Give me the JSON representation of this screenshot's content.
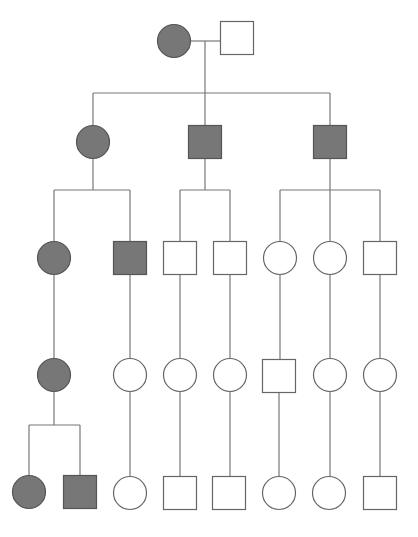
{
  "diagram": {
    "type": "pedigree",
    "colors": {
      "affected_fill": "#777777",
      "affected_stroke": "#555555",
      "unaffected_fill": "#ffffff",
      "unaffected_stroke": "#666666",
      "line": "#777777"
    },
    "symbol_size": 33,
    "individuals": [
      {
        "id": "I-1",
        "sex": "female",
        "affected": true,
        "x": 174,
        "y": 41
      },
      {
        "id": "I-2",
        "sex": "male",
        "affected": false,
        "x": 237,
        "y": 38
      },
      {
        "id": "II-1",
        "sex": "female",
        "affected": true,
        "x": 93,
        "y": 142
      },
      {
        "id": "II-2",
        "sex": "male",
        "affected": true,
        "x": 205,
        "y": 142
      },
      {
        "id": "II-3",
        "sex": "male",
        "affected": true,
        "x": 330,
        "y": 142
      },
      {
        "id": "III-1",
        "sex": "female",
        "affected": true,
        "x": 54,
        "y": 258
      },
      {
        "id": "III-2",
        "sex": "male",
        "affected": true,
        "x": 130,
        "y": 258
      },
      {
        "id": "III-3",
        "sex": "male",
        "affected": false,
        "x": 180,
        "y": 258
      },
      {
        "id": "III-4",
        "sex": "male",
        "affected": false,
        "x": 230,
        "y": 258
      },
      {
        "id": "III-5",
        "sex": "female",
        "affected": false,
        "x": 280,
        "y": 258
      },
      {
        "id": "III-6",
        "sex": "female",
        "affected": false,
        "x": 330,
        "y": 258
      },
      {
        "id": "III-7",
        "sex": "male",
        "affected": false,
        "x": 380,
        "y": 258
      },
      {
        "id": "IV-1",
        "sex": "female",
        "affected": true,
        "x": 54,
        "y": 375
      },
      {
        "id": "IV-2",
        "sex": "female",
        "affected": false,
        "x": 130,
        "y": 375
      },
      {
        "id": "IV-3",
        "sex": "female",
        "affected": false,
        "x": 180,
        "y": 375
      },
      {
        "id": "IV-4",
        "sex": "female",
        "affected": false,
        "x": 230,
        "y": 375
      },
      {
        "id": "IV-5",
        "sex": "male",
        "affected": false,
        "x": 279,
        "y": 376
      },
      {
        "id": "IV-6",
        "sex": "female",
        "affected": false,
        "x": 330,
        "y": 375
      },
      {
        "id": "IV-7",
        "sex": "female",
        "affected": false,
        "x": 380,
        "y": 375
      },
      {
        "id": "V-1",
        "sex": "female",
        "affected": true,
        "x": 29,
        "y": 492
      },
      {
        "id": "V-2",
        "sex": "male",
        "affected": true,
        "x": 80,
        "y": 492
      },
      {
        "id": "V-3",
        "sex": "female",
        "affected": false,
        "x": 130,
        "y": 493
      },
      {
        "id": "V-4",
        "sex": "male",
        "affected": false,
        "x": 180,
        "y": 493
      },
      {
        "id": "V-5",
        "sex": "male",
        "affected": false,
        "x": 229,
        "y": 493
      },
      {
        "id": "V-6",
        "sex": "female",
        "affected": false,
        "x": 279,
        "y": 493
      },
      {
        "id": "V-7",
        "sex": "female",
        "affected": false,
        "x": 329,
        "y": 493
      },
      {
        "id": "V-8",
        "sex": "male",
        "affected": false,
        "x": 380,
        "y": 493
      }
    ],
    "lines": [
      {
        "name": "mating-line-I",
        "x1": 190,
        "y1": 41,
        "x2": 221,
        "y2": 41
      },
      {
        "name": "descent-line-I",
        "x1": 205,
        "y1": 41,
        "x2": 205,
        "y2": 93
      },
      {
        "name": "sibship-line-II",
        "x1": 93,
        "y1": 93,
        "x2": 330,
        "y2": 93
      },
      {
        "name": "drop-II-1",
        "x1": 93,
        "y1": 93,
        "x2": 93,
        "y2": 126
      },
      {
        "name": "drop-II-2",
        "x1": 205,
        "y1": 93,
        "x2": 205,
        "y2": 125
      },
      {
        "name": "drop-II-3",
        "x1": 330,
        "y1": 93,
        "x2": 330,
        "y2": 125
      },
      {
        "name": "descent-line-II-1",
        "x1": 93,
        "y1": 158,
        "x2": 93,
        "y2": 190
      },
      {
        "name": "sibship-line-III-a",
        "x1": 54,
        "y1": 190,
        "x2": 130,
        "y2": 190
      },
      {
        "name": "drop-III-1",
        "x1": 54,
        "y1": 190,
        "x2": 54,
        "y2": 242
      },
      {
        "name": "drop-III-2",
        "x1": 130,
        "y1": 190,
        "x2": 130,
        "y2": 242
      },
      {
        "name": "descent-line-II-2",
        "x1": 205,
        "y1": 158,
        "x2": 205,
        "y2": 190
      },
      {
        "name": "sibship-line-III-b",
        "x1": 180,
        "y1": 190,
        "x2": 230,
        "y2": 190
      },
      {
        "name": "drop-III-3",
        "x1": 180,
        "y1": 190,
        "x2": 180,
        "y2": 242
      },
      {
        "name": "drop-III-4",
        "x1": 230,
        "y1": 190,
        "x2": 230,
        "y2": 242
      },
      {
        "name": "descent-line-II-3",
        "x1": 330,
        "y1": 158,
        "x2": 330,
        "y2": 190
      },
      {
        "name": "sibship-line-III-c",
        "x1": 280,
        "y1": 190,
        "x2": 380,
        "y2": 190
      },
      {
        "name": "drop-III-5",
        "x1": 280,
        "y1": 190,
        "x2": 280,
        "y2": 242
      },
      {
        "name": "drop-III-6",
        "x1": 330,
        "y1": 190,
        "x2": 330,
        "y2": 242
      },
      {
        "name": "drop-III-7",
        "x1": 380,
        "y1": 190,
        "x2": 380,
        "y2": 242
      },
      {
        "name": "descent-III-1",
        "x1": 54,
        "y1": 274,
        "x2": 54,
        "y2": 359
      },
      {
        "name": "descent-III-2",
        "x1": 130,
        "y1": 275,
        "x2": 130,
        "y2": 359
      },
      {
        "name": "descent-III-3",
        "x1": 180,
        "y1": 275,
        "x2": 180,
        "y2": 359
      },
      {
        "name": "descent-III-4",
        "x1": 230,
        "y1": 275,
        "x2": 230,
        "y2": 359
      },
      {
        "name": "descent-III-5",
        "x1": 280,
        "y1": 274,
        "x2": 280,
        "y2": 360
      },
      {
        "name": "descent-III-6",
        "x1": 330,
        "y1": 274,
        "x2": 330,
        "y2": 359
      },
      {
        "name": "descent-III-7",
        "x1": 380,
        "y1": 275,
        "x2": 380,
        "y2": 359
      },
      {
        "name": "descent-IV-1",
        "x1": 54,
        "y1": 391,
        "x2": 54,
        "y2": 425
      },
      {
        "name": "sibship-line-V-a",
        "x1": 29,
        "y1": 425,
        "x2": 80,
        "y2": 425
      },
      {
        "name": "drop-V-1",
        "x1": 29,
        "y1": 425,
        "x2": 29,
        "y2": 476
      },
      {
        "name": "drop-V-2",
        "x1": 80,
        "y1": 425,
        "x2": 80,
        "y2": 476
      },
      {
        "name": "descent-IV-2",
        "x1": 130,
        "y1": 391,
        "x2": 130,
        "y2": 477
      },
      {
        "name": "descent-IV-3",
        "x1": 180,
        "y1": 391,
        "x2": 180,
        "y2": 477
      },
      {
        "name": "descent-IV-4",
        "x1": 230,
        "y1": 391,
        "x2": 230,
        "y2": 477
      },
      {
        "name": "descent-IV-5",
        "x1": 279,
        "y1": 393,
        "x2": 279,
        "y2": 477
      },
      {
        "name": "descent-IV-6",
        "x1": 330,
        "y1": 391,
        "x2": 330,
        "y2": 477
      },
      {
        "name": "descent-IV-7",
        "x1": 380,
        "y1": 391,
        "x2": 380,
        "y2": 477
      }
    ]
  }
}
